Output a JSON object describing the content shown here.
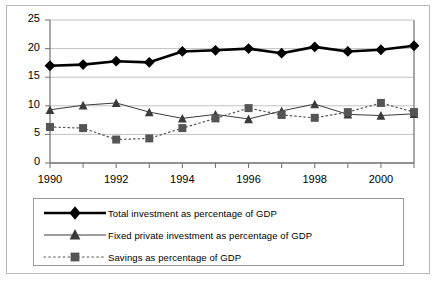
{
  "chart_data": {
    "type": "line",
    "title": "",
    "subtitle": "",
    "xlabel": "",
    "ylabel": "",
    "x": [
      1990,
      1991,
      1992,
      1993,
      1994,
      1995,
      1996,
      1997,
      1998,
      1999,
      2000,
      2001
    ],
    "categories": [
      "1990",
      "1991",
      "1992",
      "1993",
      "1994",
      "1995",
      "1996",
      "1997",
      "1998",
      "1999",
      "2000",
      "2001"
    ],
    "xlim": [
      1990,
      2001
    ],
    "ylim": [
      0,
      25
    ],
    "ytick_values": [
      0,
      5,
      10,
      15,
      20,
      25
    ],
    "ytick_labels": [
      "0",
      "5",
      "10",
      "15",
      "20",
      "25"
    ],
    "xtick_values": [
      1990,
      1991,
      1992,
      1993,
      1994,
      1995,
      1996,
      1997,
      1998,
      1999,
      2000,
      2001
    ],
    "xtick_labels": [
      "1990",
      "",
      "1992",
      "",
      "1994",
      "",
      "1996",
      "",
      "1998",
      "",
      "2000",
      ""
    ],
    "xtick_labels_shown": [
      "1990",
      "1992",
      "1994",
      "1996",
      "1998",
      "2000"
    ],
    "grid": true,
    "grid_axis": "y",
    "legend_position": "below",
    "series": [
      {
        "name": "Total investment as percentage of GDP",
        "marker": "diamond",
        "line_style": "solid",
        "line_width": 2.6,
        "color": "#000000",
        "values": [
          17.0,
          17.2,
          17.8,
          17.6,
          19.5,
          19.7,
          20.0,
          19.2,
          20.3,
          19.5,
          19.8,
          20.5
        ]
      },
      {
        "name": "Fixed private investment as percentage of GDP",
        "marker": "triangle",
        "line_style": "solid",
        "line_width": 1,
        "color": "#3b3b3b",
        "values": [
          9.3,
          10.1,
          10.5,
          8.9,
          7.8,
          8.5,
          7.7,
          9.1,
          10.3,
          8.5,
          8.3,
          8.6
        ]
      },
      {
        "name": "Savings as percentage of GDP",
        "marker": "square",
        "line_style": "dotted",
        "line_width": 1,
        "color": "#555555",
        "values": [
          6.3,
          6.1,
          4.1,
          4.3,
          6.1,
          7.8,
          9.6,
          8.4,
          7.9,
          8.9,
          10.5,
          8.9
        ]
      }
    ]
  },
  "legend": {
    "entries": [
      {
        "label": "Total investment as percentage of GDP",
        "marker": "diamond-marker",
        "style": "thick-solid"
      },
      {
        "label": "Fixed private investment as percentage of GDP",
        "marker": "triangle-marker",
        "style": "thin-solid"
      },
      {
        "label": "Savings as percentage of GDP",
        "marker": "square-marker",
        "style": "dotted"
      }
    ]
  },
  "colors": {
    "axis": "#6f6f6f",
    "grid": "#c2c2c2",
    "frame": "#b9b9b9",
    "legend_border": "#9a9a9a",
    "text": "#000000",
    "series_total": "#000000",
    "series_fixed": "#3b3b3b",
    "series_savings": "#555555"
  }
}
